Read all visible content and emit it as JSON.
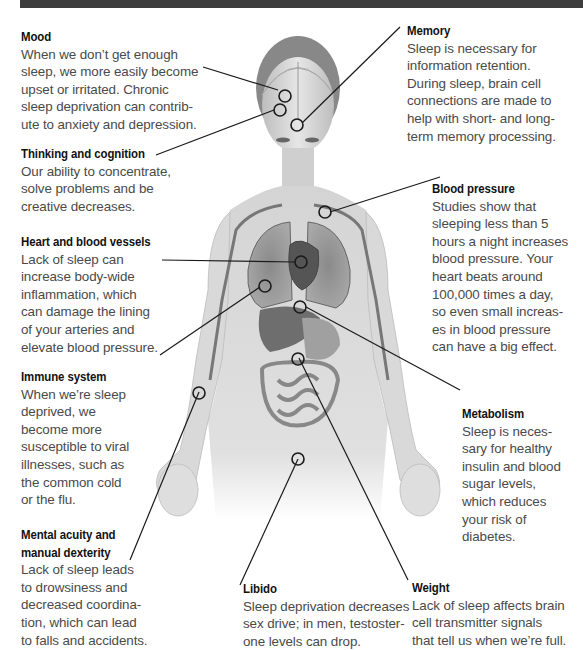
{
  "figure": {
    "colors": {
      "top_bar": "#3d3d3d",
      "title_text": "#111111",
      "body_text": "#4a4a4a",
      "leader_lines": "#1a1a1a"
    }
  },
  "callouts": [
    {
      "id": "mood",
      "title": "Mood",
      "lines": [
        "When we don’t get enough",
        "sleep, we more easily become",
        "upset or irritated. Chronic",
        "sleep deprivation can contrib-",
        "ute to anxiety and depression."
      ]
    },
    {
      "id": "thinking",
      "title": "Thinking and cognition",
      "lines": [
        "Our ability to concentrate,",
        "solve problems and be",
        "creative decreases."
      ]
    },
    {
      "id": "heart",
      "title": "Heart and blood vessels",
      "lines": [
        "Lack of sleep can",
        "increase body-wide",
        "inflammation, which",
        "can damage the lining",
        "of your arteries and",
        "elevate blood pressure."
      ]
    },
    {
      "id": "immune",
      "title": "Immune system",
      "lines": [
        "When we’re sleep",
        "deprived, we",
        "become more",
        "susceptible to viral",
        "illnesses, such as",
        "the common cold",
        "or the flu."
      ]
    },
    {
      "id": "mental",
      "title": "Mental acuity and manual dexterity",
      "title_lines": [
        "Mental acuity and",
        "manual dexterity"
      ],
      "lines": [
        "Lack of sleep leads",
        "to drowsiness and",
        "decreased coordina-",
        "tion, which can lead",
        "to falls and accidents."
      ]
    },
    {
      "id": "libido",
      "title": "Libido",
      "lines": [
        "Sleep deprivation decreases",
        "sex drive; in men, testoster-",
        "one levels can drop."
      ]
    },
    {
      "id": "memory",
      "title": "Memory",
      "lines": [
        "Sleep is necessary for",
        "information retention.",
        "During sleep, brain cell",
        "connections are made to",
        "help with short- and long-",
        "term memory processing."
      ]
    },
    {
      "id": "blood_pressure",
      "title": "Blood pressure",
      "lines": [
        "Studies show that",
        "sleeping less than 5",
        "hours a night increases",
        "blood pressure. Your",
        "heart beats around",
        "100,000 times a day,",
        "so even small increas-",
        "es in blood pressure",
        "can have a big effect."
      ]
    },
    {
      "id": "metabolism",
      "title": "Metabolism",
      "lines": [
        "Sleep is neces-",
        "sary for healthy",
        "insulin and blood",
        "sugar levels,",
        "which reduces",
        "your risk of",
        "diabetes."
      ]
    },
    {
      "id": "weight",
      "title": "Weight",
      "lines": [
        "Lack of sleep affects brain",
        "cell transmitter signals",
        "that tell us when we’re full."
      ]
    }
  ]
}
